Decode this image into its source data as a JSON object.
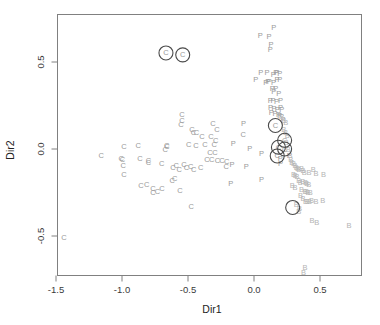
{
  "figure": {
    "title": "",
    "width": 380,
    "height": 325
  },
  "axes": {
    "x_label": "Dir1",
    "y_label": "Dir2",
    "x_ticks": [
      "-1.5",
      "-1.0",
      "-0.5",
      "0.0",
      "0.5"
    ],
    "y_ticks": [
      "0.5",
      "0.0",
      "-0.5"
    ]
  },
  "colors": {
    "class_C": "#9a9a9a",
    "class_P": "#9a9a9a",
    "class_B": "#b4b4b4",
    "axis": "#808080",
    "highlight_ring": "#4a4a4a",
    "text": "#3a3a3a"
  },
  "chart_data": {
    "type": "scatter",
    "title": "",
    "xlabel": "Dir1",
    "ylabel": "Dir2",
    "xlim": [
      -1.545,
      0.765
    ],
    "ylim": [
      -0.762,
      0.762
    ],
    "grid": false,
    "legend": "none",
    "x_ticks": [
      -1.5,
      -1.0,
      -0.5,
      0.0,
      0.5
    ],
    "y_ticks": [
      0.5,
      0.0,
      -0.5
    ],
    "marker_style": "text-glyph",
    "series": [
      {
        "name": "C",
        "label_glyph": "C",
        "color": "#9a9a9a",
        "points": [
          [
            -0.667,
            0.552
          ],
          [
            -0.54,
            0.541
          ],
          [
            -0.545,
            0.2
          ],
          [
            -0.545,
            0.165
          ],
          [
            -0.553,
            0.14
          ],
          [
            -0.47,
            0.111
          ],
          [
            -0.458,
            0.095
          ],
          [
            -0.436,
            0.095
          ],
          [
            -0.394,
            0.074
          ],
          [
            -0.311,
            0.148
          ],
          [
            -0.281,
            0.11
          ],
          [
            -0.327,
            0.07
          ],
          [
            -0.29,
            0.049
          ],
          [
            -0.302,
            0.025
          ],
          [
            -0.371,
            0.024
          ],
          [
            -0.334,
            -0.02
          ],
          [
            -0.295,
            -0.021
          ],
          [
            -0.44,
            0.022
          ],
          [
            -0.494,
            0.026
          ],
          [
            -0.662,
            0.022
          ],
          [
            -0.66,
            0.013
          ],
          [
            -0.672,
            0.0
          ],
          [
            -0.877,
            0.023
          ],
          [
            -0.985,
            0.016
          ],
          [
            -1.157,
            -0.036
          ],
          [
            -1.006,
            -0.057
          ],
          [
            -0.996,
            -0.063
          ],
          [
            -0.991,
            -0.095
          ],
          [
            -0.986,
            -0.145
          ],
          [
            -0.864,
            -0.055
          ],
          [
            -0.8,
            -0.065
          ],
          [
            -0.8,
            -0.075
          ],
          [
            -0.7,
            -0.085
          ],
          [
            -0.614,
            -0.107
          ],
          [
            -0.59,
            -0.095
          ],
          [
            -0.566,
            -0.115
          ],
          [
            -0.53,
            -0.09
          ],
          [
            -0.512,
            -0.104
          ],
          [
            -0.48,
            -0.101
          ],
          [
            -0.456,
            -0.119
          ],
          [
            -0.404,
            -0.108
          ],
          [
            -0.356,
            -0.058
          ],
          [
            -0.32,
            -0.06
          ],
          [
            -0.276,
            -0.064
          ],
          [
            -0.243,
            -0.065
          ],
          [
            -0.856,
            -0.211
          ],
          [
            -0.812,
            -0.203
          ],
          [
            -0.766,
            -0.226
          ],
          [
            -0.765,
            -0.248
          ],
          [
            -0.731,
            -0.246
          ],
          [
            -0.697,
            -0.229
          ],
          [
            -0.62,
            -0.18
          ],
          [
            -0.6,
            -0.17
          ],
          [
            -0.56,
            -0.24
          ],
          [
            -0.475,
            -0.33
          ],
          [
            -1.44,
            -0.51
          ],
          [
            0.162,
            0.135
          ],
          [
            0.232,
            0.05
          ],
          [
            0.185,
            0.01
          ],
          [
            0.232,
            0.0
          ],
          [
            0.176,
            -0.04
          ],
          [
            -0.082,
            0.085
          ],
          [
            -0.207,
            -0.073
          ],
          [
            -0.21,
            -0.1
          ]
        ]
      },
      {
        "name": "P",
        "label_glyph": "P",
        "color": "#9a9a9a",
        "points": [
          [
            0.15,
            0.7
          ],
          [
            0.048,
            0.653
          ],
          [
            0.114,
            0.646
          ],
          [
            0.128,
            0.6
          ],
          [
            0.124,
            0.57
          ],
          [
            0.052,
            0.442
          ],
          [
            0.098,
            0.44
          ],
          [
            0.145,
            0.43
          ],
          [
            0.165,
            0.437
          ],
          [
            0.175,
            0.437
          ],
          [
            0.196,
            0.432
          ],
          [
            0.014,
            0.398
          ],
          [
            0.09,
            0.385
          ],
          [
            0.104,
            0.39
          ],
          [
            0.115,
            0.386
          ],
          [
            0.148,
            0.382
          ],
          [
            0.175,
            0.4
          ],
          [
            0.196,
            0.4
          ],
          [
            0.139,
            0.35
          ],
          [
            0.165,
            0.345
          ],
          [
            0.15,
            0.33
          ],
          [
            0.188,
            0.32
          ],
          [
            0.124,
            0.28
          ],
          [
            0.144,
            0.278
          ],
          [
            0.17,
            0.272
          ],
          [
            0.2,
            0.28
          ],
          [
            0.126,
            0.24
          ],
          [
            0.152,
            0.232
          ],
          [
            0.176,
            0.228
          ],
          [
            0.2,
            0.24
          ],
          [
            0.21,
            0.225
          ],
          [
            0.13,
            0.212
          ],
          [
            0.16,
            0.205
          ],
          [
            0.186,
            0.2
          ],
          [
            0.196,
            0.195
          ],
          [
            -0.08,
            0.148
          ],
          [
            -0.158,
            0.03
          ],
          [
            -0.167,
            -0.09
          ],
          [
            -0.177,
            -0.2
          ],
          [
            -0.058,
            -0.1
          ],
          [
            -0.032,
            0.003
          ],
          [
            0.057,
            -0.025
          ],
          [
            0.057,
            -0.175
          ],
          [
            0.198,
            -0.055
          ],
          [
            0.2,
            -0.085
          ],
          [
            0.268,
            -0.035
          ],
          [
            0.22,
            0.17
          ],
          [
            0.208,
            0.185
          ]
        ]
      },
      {
        "name": "B",
        "label_glyph": "B",
        "color": "#b4b4b4",
        "points": [
          [
            0.225,
            0.165
          ],
          [
            0.24,
            0.15
          ],
          [
            0.226,
            0.11
          ],
          [
            0.238,
            0.095
          ],
          [
            0.252,
            0.08
          ],
          [
            0.245,
            0.035
          ],
          [
            0.26,
            0.0
          ],
          [
            0.272,
            -0.035
          ],
          [
            0.278,
            -0.06
          ],
          [
            0.287,
            -0.075
          ],
          [
            0.3,
            -0.085
          ],
          [
            0.31,
            -0.095
          ],
          [
            0.32,
            -0.105
          ],
          [
            0.33,
            -0.112
          ],
          [
            0.34,
            -0.118
          ],
          [
            0.36,
            -0.112
          ],
          [
            0.372,
            -0.125
          ],
          [
            0.38,
            -0.135
          ],
          [
            0.416,
            -0.135
          ],
          [
            0.448,
            -0.118
          ],
          [
            0.47,
            -0.14
          ],
          [
            0.527,
            -0.145
          ],
          [
            0.3,
            -0.147
          ],
          [
            0.312,
            -0.15
          ],
          [
            0.326,
            -0.16
          ],
          [
            0.34,
            -0.18
          ],
          [
            0.35,
            -0.19
          ],
          [
            0.37,
            -0.185
          ],
          [
            0.39,
            -0.192
          ],
          [
            0.4,
            -0.2
          ],
          [
            0.414,
            -0.205
          ],
          [
            0.29,
            -0.207
          ],
          [
            0.31,
            -0.22
          ],
          [
            0.36,
            -0.235
          ],
          [
            0.386,
            -0.245
          ],
          [
            0.398,
            -0.247
          ],
          [
            0.41,
            -0.25
          ],
          [
            0.426,
            -0.252
          ],
          [
            0.352,
            -0.27
          ],
          [
            0.372,
            -0.285
          ],
          [
            0.39,
            -0.3
          ],
          [
            0.404,
            -0.3
          ],
          [
            0.42,
            -0.302
          ],
          [
            0.435,
            -0.298
          ],
          [
            0.47,
            -0.3
          ],
          [
            0.52,
            -0.298
          ],
          [
            0.32,
            -0.32
          ],
          [
            0.344,
            -0.34
          ],
          [
            0.34,
            -0.36
          ],
          [
            0.44,
            -0.41
          ],
          [
            0.475,
            -0.42
          ],
          [
            0.72,
            -0.44
          ],
          [
            0.386,
            -0.68
          ],
          [
            0.376,
            -0.71
          ]
        ]
      }
    ],
    "highlighted": {
      "description": "circled (ringed) observations",
      "ring_radius_px": 7,
      "points": [
        [
          -0.667,
          0.552,
          "C"
        ],
        [
          -0.54,
          0.541,
          "C"
        ],
        [
          0.162,
          0.135,
          "C"
        ],
        [
          0.232,
          0.05,
          "C"
        ],
        [
          0.185,
          0.01,
          "C"
        ],
        [
          0.232,
          0.0,
          "C"
        ],
        [
          0.176,
          -0.04,
          "C"
        ],
        [
          0.293,
          -0.336,
          "B"
        ]
      ]
    }
  }
}
